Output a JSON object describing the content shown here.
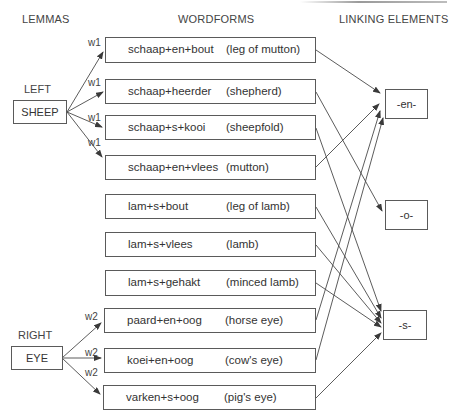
{
  "headers": {
    "lemmas": "LEMMAS",
    "wordforms": "WORDFORMS",
    "linking_elements": "LINKING ELEMENTS"
  },
  "lemmas": [
    {
      "side_label": "LEFT",
      "name": "SHEEP",
      "weight_label": "w1"
    },
    {
      "side_label": "RIGHT",
      "name": "EYE",
      "weight_label": "w2"
    }
  ],
  "wordforms": [
    {
      "form": "schaap+en+bout",
      "gloss": "(leg of mutton)",
      "lemma": "SHEEP",
      "weight": "w1",
      "links_to": "-en-"
    },
    {
      "form": "schaap+heerder",
      "gloss": "(shepherd)",
      "lemma": "SHEEP",
      "weight": "w1",
      "links_to": "-o-"
    },
    {
      "form": "schaap+s+kooi",
      "gloss": "(sheepfold)",
      "lemma": "SHEEP",
      "weight": "w1",
      "links_to": "-s-"
    },
    {
      "form": "schaap+en+vlees",
      "gloss": "(mutton)",
      "lemma": "SHEEP",
      "weight": "w1",
      "links_to": "-en-"
    },
    {
      "form": "lam+s+bout",
      "gloss": "(leg of lamb)",
      "lemma": null,
      "weight": null,
      "links_to": "-s-"
    },
    {
      "form": "lam+s+vlees",
      "gloss": "(lamb)",
      "lemma": null,
      "weight": null,
      "links_to": "-s-"
    },
    {
      "form": "lam+s+gehakt",
      "gloss": "(minced lamb)",
      "lemma": null,
      "weight": null,
      "links_to": "-s-"
    },
    {
      "form": "paard+en+oog",
      "gloss": "(horse eye)",
      "lemma": "EYE",
      "weight": "w2",
      "links_to": "-en-"
    },
    {
      "form": "koei+en+oog",
      "gloss": "(cow's eye)",
      "lemma": "EYE",
      "weight": "w2",
      "links_to": "-en-"
    },
    {
      "form": "varken+s+oog",
      "gloss": "(pig's eye)",
      "lemma": "EYE",
      "weight": "w2",
      "links_to": "-s-"
    }
  ],
  "linking_elements": [
    {
      "label": "-en-"
    },
    {
      "label": "-o-"
    },
    {
      "label": "-s-"
    }
  ],
  "weight_labels": [
    "w1",
    "w1",
    "w1",
    "w1",
    "w2",
    "w2",
    "w2"
  ],
  "colors": {
    "line": "#4a4a4a",
    "box_border": "#5a5a5a",
    "text": "#333333"
  }
}
